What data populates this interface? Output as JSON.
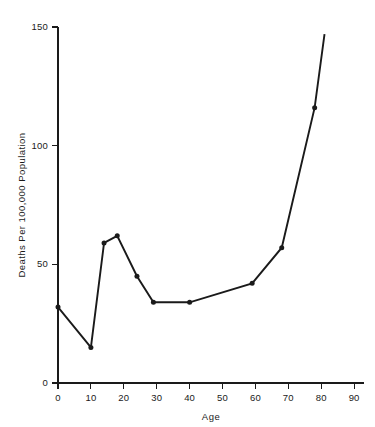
{
  "chart_data": {
    "type": "line",
    "title": "",
    "subtitle": "",
    "xlabel": "Age",
    "ylabel": "Deaths Per 100,000 Population",
    "xlim": [
      0,
      93
    ],
    "ylim": [
      0,
      150
    ],
    "xticks": [
      0,
      10,
      20,
      30,
      40,
      50,
      60,
      70,
      80,
      90
    ],
    "xtick_labels": [
      "0",
      "10",
      "20",
      "30",
      "40",
      "50",
      "60",
      "70",
      "80",
      "90"
    ],
    "yticks": [
      0,
      50,
      100,
      150
    ],
    "ytick_labels": [
      "0",
      "50",
      "100",
      "150"
    ],
    "grid": false,
    "legend": null,
    "legend_position": "none",
    "marker": "filled-circle",
    "line_color": "#1a1a1a",
    "marker_color": "#1a1a1a",
    "axis_color": "#1a1a1a",
    "background_color": "#ffffff",
    "annotations": [],
    "series": [
      {
        "name": "Deaths Per 100,000 Population",
        "x": [
          0,
          10,
          14,
          18,
          24,
          29,
          40,
          59,
          68,
          78,
          81
        ],
        "values": [
          32,
          15,
          59,
          62,
          45,
          34,
          34,
          42,
          57,
          116,
          147
        ],
        "markers": [
          true,
          true,
          true,
          true,
          true,
          true,
          true,
          true,
          true,
          true,
          false
        ]
      }
    ]
  }
}
